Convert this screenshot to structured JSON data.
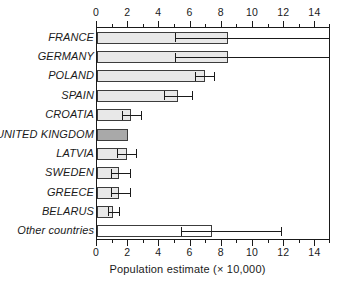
{
  "chart_data": {
    "type": "bar",
    "orientation": "horizontal",
    "title": "",
    "xlabel": "Population estimate (× 10,000)",
    "ylabel": "",
    "xlim": [
      0,
      15
    ],
    "xticks": [
      0,
      2,
      4,
      6,
      8,
      10,
      12,
      14
    ],
    "xticklabels": [
      "0",
      "2",
      "4",
      "6",
      "8",
      "10",
      "12",
      "14"
    ],
    "minor_ticks": [
      1,
      3,
      5,
      7,
      9,
      11,
      13,
      15
    ],
    "grid": false,
    "legend": null,
    "axis_top": true,
    "axis_bottom": true,
    "categories": [
      "FRANCE",
      "GERMANY",
      "POLAND",
      "SPAIN",
      "CROATIA",
      "UNITED KINGDOM",
      "LATVIA",
      "SWEDEN",
      "GREECE",
      "BELARUS",
      "Other countries"
    ],
    "values": [
      8.4,
      8.4,
      6.9,
      5.2,
      2.2,
      2.0,
      1.9,
      1.4,
      1.4,
      1.0,
      7.4
    ],
    "errors_low": [
      5.0,
      5.0,
      6.3,
      4.3,
      1.6,
      null,
      1.3,
      0.9,
      0.9,
      0.7,
      5.4
    ],
    "errors_high": [
      15.0,
      15.0,
      7.5,
      6.1,
      2.8,
      null,
      2.5,
      2.1,
      2.1,
      1.4,
      11.8
    ],
    "error_high_clipped": [
      true,
      true,
      false,
      false,
      false,
      false,
      false,
      false,
      false,
      false,
      false
    ],
    "bar_styles": [
      "light",
      "light",
      "light",
      "light",
      "light",
      "highlight",
      "light",
      "light",
      "light",
      "light",
      "open"
    ],
    "colors": {
      "bar_light": "#e8e8e8",
      "bar_highlight": "#a9a9a9",
      "bar_open": "#ffffff",
      "bar_edge": "#3c3c3c",
      "axis": "#1a1a1a",
      "text": "#1a1a1a",
      "background": "#ffffff"
    }
  }
}
